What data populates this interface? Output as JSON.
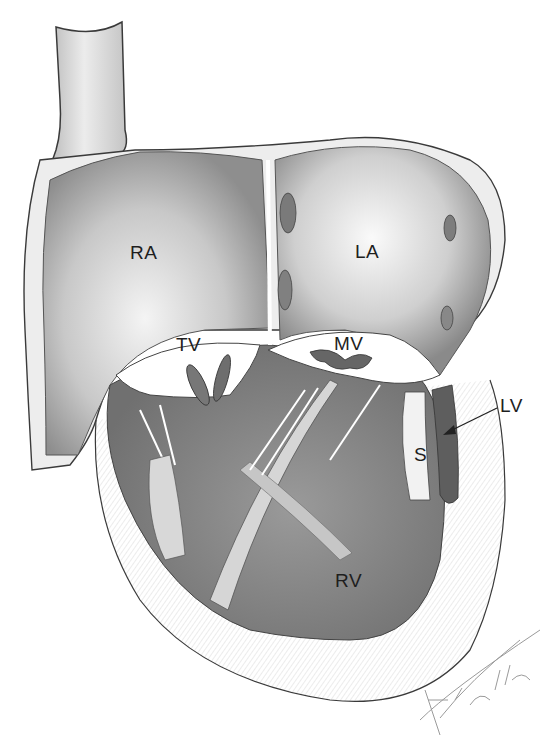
{
  "figure": {
    "type": "anatomical illustration",
    "style": "pencil drawing",
    "labels": {
      "ra": "RA",
      "la": "LA",
      "tv": "TV",
      "mv": "MV",
      "lv": "LV",
      "s": "S",
      "rv": "RV"
    },
    "signature": "Fncll '92"
  },
  "colors": {
    "background": "#ffffff",
    "shade_light": "#d4d4d4",
    "shade_mid": "#a8a8a8",
    "shade_dark": "#6a6a6a",
    "line": "#3a3a3a"
  }
}
